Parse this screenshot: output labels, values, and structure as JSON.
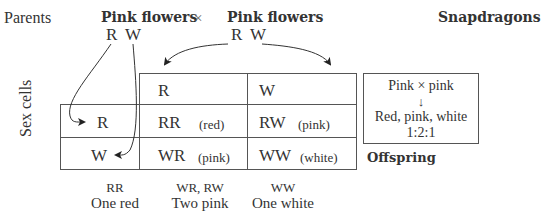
{
  "title": "Snapdragons",
  "parents": {
    "label": "Parents",
    "left": {
      "phenotype": "Pink flowers",
      "alleles": [
        "R",
        "W"
      ]
    },
    "cross_symbol": "×",
    "right": {
      "phenotype": "Pink flowers",
      "alleles": [
        "R",
        "W"
      ]
    }
  },
  "side_label": "Sex cells",
  "grid": {
    "col_headers": [
      "R",
      "W"
    ],
    "row_headers": [
      "R",
      "W"
    ],
    "cells": [
      [
        {
          "genotype": "RR",
          "phenotype": "(red)"
        },
        {
          "genotype": "RW",
          "phenotype": "(pink)"
        }
      ],
      [
        {
          "genotype": "WR",
          "phenotype": "(pink)"
        },
        {
          "genotype": "WW",
          "phenotype": "(white)"
        }
      ]
    ]
  },
  "summary_box": {
    "cross": "Pink × pink",
    "arrow": "↓",
    "result": "Red, pink, white",
    "ratio": "1:2:1"
  },
  "offspring_label": "Offspring",
  "totals": [
    {
      "genotypes": "RR",
      "description": "One red"
    },
    {
      "genotypes": "WR, RW",
      "description": "Two pink"
    },
    {
      "genotypes": "WW",
      "description": "One white"
    }
  ]
}
